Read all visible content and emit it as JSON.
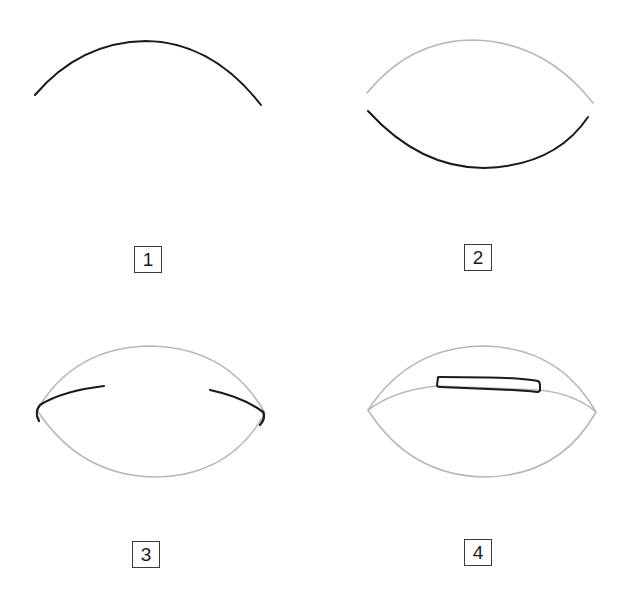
{
  "figure": {
    "colors": {
      "active_stroke": "#1a1a1a",
      "guide_stroke": "#b8b8b8",
      "label_border": "#3a3a3a",
      "background": "#ffffff"
    },
    "steps": [
      {
        "number": "1",
        "caption": "Draw upper arc"
      },
      {
        "number": "2",
        "caption": "Draw lower arc"
      },
      {
        "number": "3",
        "caption": "Draw corner strokes"
      },
      {
        "number": "4",
        "caption": "Draw inner band"
      }
    ]
  }
}
